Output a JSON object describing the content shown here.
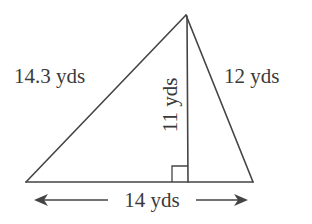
{
  "diagram": {
    "type": "triangle",
    "units": "yds",
    "vertices": {
      "left": [
        26,
        182
      ],
      "apex": [
        186,
        15
      ],
      "right": [
        253,
        182
      ],
      "altitude_foot": [
        188,
        182
      ]
    },
    "labels": {
      "left_side": "14.3 yds",
      "right_side": "12 yds",
      "height": "11 yds",
      "base": "14 yds"
    },
    "measurements": {
      "left_side": 14.3,
      "right_side": 12,
      "height": 11,
      "base": 14
    },
    "right_angle_marker": true,
    "base_dimension_arrows": true,
    "colors": {
      "line": "#444444",
      "text": "#3a3a3a",
      "background": "#ffffff"
    }
  }
}
